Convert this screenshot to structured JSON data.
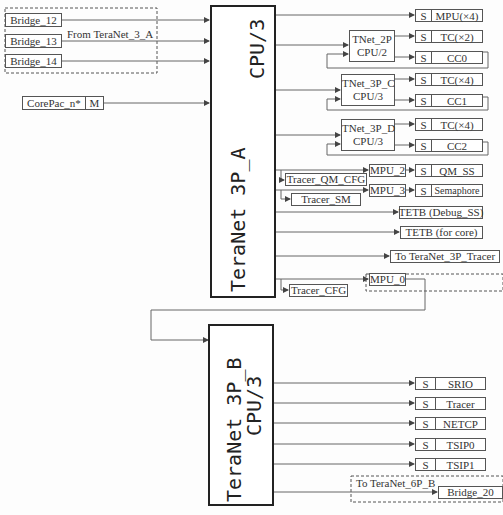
{
  "inputs": {
    "bridges": [
      "Bridge_12",
      "Bridge_13",
      "Bridge_14"
    ],
    "bridge_group_label": "From TeraNet_3_A",
    "corepac": "CorePac_n*",
    "corepac_port": "M"
  },
  "teranet_a": {
    "title_line1": "TeraNet 3P_A",
    "title_line2": "CPU/3"
  },
  "teranet_b": {
    "title_line1": "TeraNet 3P_B",
    "title_line2": "CPU/3"
  },
  "sub_switches": [
    {
      "name": "TNet_2P",
      "clock": "CPU/2"
    },
    {
      "name": "TNet_3P_C",
      "clock": "CPU/3"
    },
    {
      "name": "TNet_3P_D",
      "clock": "CPU/3"
    }
  ],
  "slave_port_label": "S",
  "a_slaves": [
    "MPU(×4)",
    "TC(×2)",
    "CC0",
    "TC(×4)",
    "CC1",
    "TC(×4)",
    "CC2",
    "QM_SS",
    "Semaphore"
  ],
  "mpus": [
    "MPU_2",
    "MPU_3",
    "MPU_0"
  ],
  "tracers": [
    "Tracer_QM_CFG",
    "Tracer_SM",
    "Tracer_CFG"
  ],
  "tetb": [
    "TETB (Debug_SS)",
    "TETB (for core)"
  ],
  "to_tracer": "To TeraNet_3P_Tracer",
  "b_slaves": [
    "SRIO",
    "Tracer",
    "NETCP",
    "TSIP0",
    "TSIP1"
  ],
  "to_6p": "To TeraNet_6P_B",
  "bridge_20": "Bridge_20"
}
